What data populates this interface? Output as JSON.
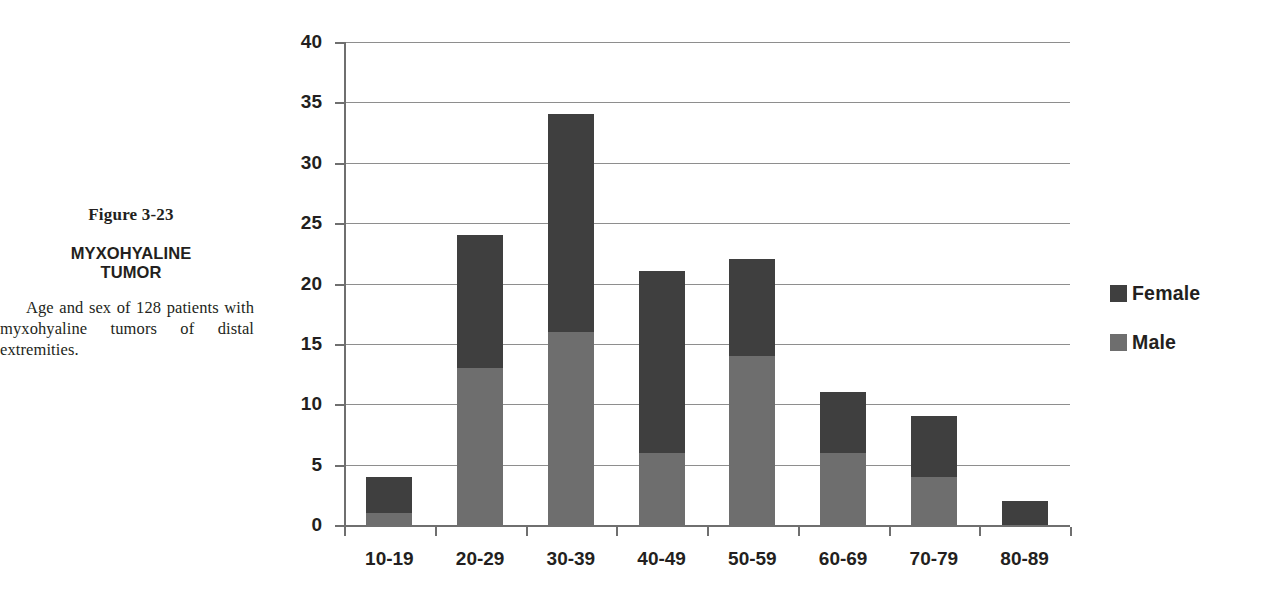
{
  "caption": {
    "figure_number": "Figure 3-23",
    "title_line_1": "MYXOHYALINE",
    "title_line_2": "TUMOR",
    "body": "Age and sex of 128 patients with myxohyaline tumors of distal extremities."
  },
  "legend": {
    "items": [
      {
        "label": "Female",
        "color": "#3f3f3f",
        "swatch": "legend-swatch-female"
      },
      {
        "label": "Male",
        "color": "#6e6e6e",
        "swatch": "legend-swatch-male"
      }
    ]
  },
  "chart_data": {
    "type": "bar",
    "stacked": true,
    "title": "",
    "xlabel": "",
    "ylabel": "",
    "categories": [
      "10-19",
      "20-29",
      "30-39",
      "40-49",
      "50-59",
      "60-69",
      "70-79",
      "80-89"
    ],
    "series": [
      {
        "name": "Male",
        "color": "#6e6e6e",
        "values": [
          1,
          13,
          16,
          6,
          14,
          6,
          4,
          0
        ]
      },
      {
        "name": "Female",
        "color": "#3f3f3f",
        "values": [
          3,
          11,
          18,
          15,
          8,
          5,
          5,
          2
        ]
      }
    ],
    "totals": [
      4,
      24,
      34,
      21,
      22,
      11,
      9,
      2
    ],
    "ylim": [
      0,
      40
    ],
    "ytick_step": 5,
    "yticks": [
      0,
      5,
      10,
      15,
      20,
      25,
      30,
      35,
      40
    ],
    "ytick_labels": [
      "0",
      "5",
      "10",
      "15",
      "20",
      "25",
      "30",
      "35",
      "40"
    ],
    "grid": true,
    "grid_axis": "y",
    "legend_position": "right"
  }
}
